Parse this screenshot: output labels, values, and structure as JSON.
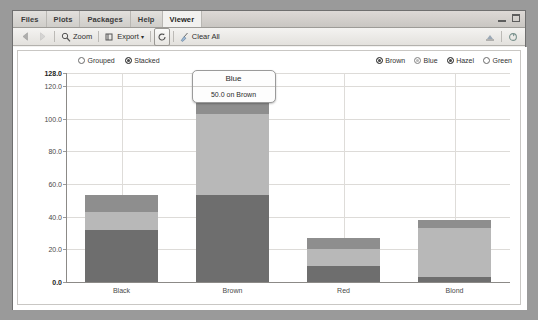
{
  "window": {
    "minimize_icon": "minimize-icon",
    "maximize_icon": "maximize-icon"
  },
  "tabstrip": {
    "tabs": [
      {
        "label": "Files",
        "active": false
      },
      {
        "label": "Plots",
        "active": false
      },
      {
        "label": "Packages",
        "active": false
      },
      {
        "label": "Help",
        "active": false
      },
      {
        "label": "Viewer",
        "active": true
      }
    ]
  },
  "toolbar": {
    "back_icon": "back-arrow-icon",
    "forward_icon": "forward-arrow-icon",
    "zoom_label": "Zoom",
    "zoom_icon": "magnifier-icon",
    "export_label": "Export",
    "export_caret": "▾",
    "export_icon": "export-icon",
    "refresh_icon": "refresh-icon",
    "clear_all_label": "Clear All",
    "clear_all_icon": "broom-icon",
    "right_icon_1": "publish-icon",
    "right_icon_2": "refresh-viewer-icon"
  },
  "plot": {
    "mode_legend": [
      {
        "label": "Grouped",
        "selected": false
      },
      {
        "label": "Stacked",
        "selected": true
      }
    ],
    "series_legend": [
      {
        "label": "Brown",
        "state": "on",
        "color": "#6e6e6e"
      },
      {
        "label": "Blue",
        "state": "dim",
        "color": "#b3b3b3"
      },
      {
        "label": "Hazel",
        "state": "on",
        "color": "#8f8f8f"
      },
      {
        "label": "Green",
        "state": "off",
        "color": "#ffffff"
      }
    ],
    "tooltip": {
      "title": "Blue",
      "body": "50.0 on Brown"
    }
  },
  "chart_data": {
    "type": "bar",
    "subtype": "stacked",
    "title": "",
    "xlabel": "",
    "ylabel": "",
    "categories": [
      "Black",
      "Brown",
      "Red",
      "Blond"
    ],
    "series": [
      {
        "name": "Brown",
        "color": "#6e6e6e",
        "values": [
          32,
          53,
          10,
          3
        ]
      },
      {
        "name": "Blue",
        "color": "#b8b8b8",
        "values": [
          11,
          50,
          10,
          30
        ]
      },
      {
        "name": "Hazel",
        "color": "#8e8e8e",
        "values": [
          10,
          25,
          7,
          5
        ]
      },
      {
        "name": "Green",
        "color": "#ffffff",
        "values": [
          0,
          0,
          0,
          0
        ]
      }
    ],
    "totals": [
      52,
      128,
      27,
      38
    ],
    "ylim": [
      0,
      128
    ],
    "yticks": [
      {
        "value": 128.0,
        "label": "128.0",
        "bold": true
      },
      {
        "value": 120.0,
        "label": "120.0",
        "bold": false
      },
      {
        "value": 100.0,
        "label": "100.0",
        "bold": false
      },
      {
        "value": 80.0,
        "label": "80.0",
        "bold": false
      },
      {
        "value": 60.0,
        "label": "60.0",
        "bold": false
      },
      {
        "value": 40.0,
        "label": "40.0",
        "bold": false
      },
      {
        "value": 20.0,
        "label": "20.0",
        "bold": false
      },
      {
        "value": 0.0,
        "label": "0.0",
        "bold": true
      }
    ],
    "grid": true,
    "legend_position": "top"
  }
}
